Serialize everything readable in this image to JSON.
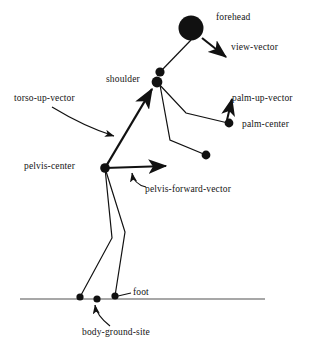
{
  "figure": {
    "background_color": "#ffffff",
    "ink_color": "#111111",
    "ground_color": "#8a8a8a",
    "labels": {
      "forehead": "forehead",
      "view_vector": "view-vector",
      "shoulder": "shoulder",
      "torso_up_vector": "torso-up-vector",
      "palm_up_vector": "palm-up-vector",
      "palm_center": "palm-center",
      "pelvis_center": "pelvis-center",
      "pelvis_forward_vector": "pelvis-forward-vector",
      "foot": "foot",
      "body_ground_site": "body-ground-site"
    },
    "joints": [
      {
        "name": "forehead",
        "x": 191,
        "y": 28,
        "r": 12.5
      },
      {
        "name": "neck",
        "x": 160,
        "y": 72,
        "r": 4.6
      },
      {
        "name": "shoulder",
        "x": 157,
        "y": 82,
        "r": 5.4
      },
      {
        "name": "pelvis-center",
        "x": 105,
        "y": 168,
        "r": 4.6
      },
      {
        "name": "palm-center",
        "x": 229,
        "y": 123,
        "r": 4.4
      },
      {
        "name": "hand-lower",
        "x": 206,
        "y": 155,
        "r": 4.4
      },
      {
        "name": "foot-rear",
        "x": 80,
        "y": 297,
        "r": 3.6
      },
      {
        "name": "foot-middle",
        "x": 97,
        "y": 299,
        "r": 3.6
      },
      {
        "name": "foot-front",
        "x": 115,
        "y": 296,
        "r": 3.6
      }
    ],
    "ground_line": {
      "x1": 20,
      "y1": 299,
      "x2": 265,
      "y2": 299
    },
    "segments": [
      {
        "name": "head-to-neck",
        "points": "191,40 160,72"
      },
      {
        "name": "upper-arm-right",
        "points": "157,82 186,113 228,123"
      },
      {
        "name": "upper-arm-left",
        "points": "160,85 170,140 206,155"
      },
      {
        "name": "leg-front-thigh",
        "points": "105,168 125,232 115,296"
      },
      {
        "name": "leg-rear-thigh",
        "points": "105,168 112,238 80,297"
      }
    ],
    "vectors": [
      {
        "name": "view-vector",
        "x1": 202,
        "y1": 38,
        "x2": 227,
        "y2": 58
      },
      {
        "name": "torso-up-vector",
        "x1": 105,
        "y1": 168,
        "x2": 152,
        "y2": 88
      },
      {
        "name": "pelvis-forward-vector",
        "x1": 105,
        "y1": 168,
        "x2": 168,
        "y2": 166
      },
      {
        "name": "palm-up-vector",
        "x1": 228,
        "y1": 120,
        "x2": 233,
        "y2": 98
      }
    ],
    "leader_curves": [
      {
        "name": "torso-up-leader",
        "path": "M 52,107 C 75,121 95,130 116,136"
      },
      {
        "name": "pelvis-fwd-leader",
        "path": "M 146,186 C 137,184 133,179 132,172"
      },
      {
        "name": "ground-site-leader",
        "path": "M 110,325 C 101,318 96,311 95,304"
      }
    ],
    "leader_lines": [
      {
        "name": "foot-leader",
        "x1": 131,
        "y1": 293,
        "x2": 116,
        "y2": 296
      }
    ]
  }
}
